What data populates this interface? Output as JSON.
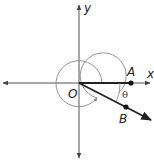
{
  "diagram": {
    "type": "angle-in-standard-position",
    "labels": {
      "x_axis": "x",
      "y_axis": "y",
      "origin": "O",
      "point_a": "A",
      "point_b": "B",
      "angle": "θ"
    },
    "colors": {
      "axes": "#555555",
      "ray": "#222222",
      "circle": "#888888"
    }
  }
}
